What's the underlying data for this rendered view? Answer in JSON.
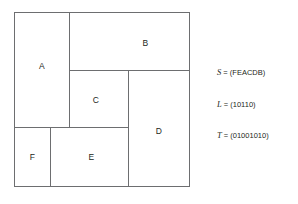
{
  "figure": {
    "line_color": "#6d6e70",
    "text_color": "#231f20",
    "background": "#ffffff"
  },
  "floorplan": {
    "outline": {
      "x": 14,
      "y": 12,
      "width": 176,
      "height": 175
    },
    "blocks": [
      {
        "id": "A",
        "label": "A",
        "x": 0,
        "y": 0,
        "width": 56,
        "height": 116
      },
      {
        "id": "B",
        "label": "B",
        "x": 55,
        "y": 0,
        "width": 121,
        "height": 59
      },
      {
        "id": "C",
        "label": "C",
        "x": 55,
        "y": 58,
        "width": 60,
        "height": 58
      },
      {
        "id": "D",
        "label": "D",
        "x": 114,
        "y": 58,
        "width": 62,
        "height": 117
      },
      {
        "id": "E",
        "label": "E",
        "x": 36,
        "y": 115,
        "width": 79,
        "height": 60
      },
      {
        "id": "F",
        "label": "F",
        "x": 0,
        "y": 115,
        "width": 37,
        "height": 60
      }
    ]
  },
  "equations": [
    {
      "name": "sequence-s",
      "symbol": "S",
      "operator": " = ",
      "value": "(FEACDB)",
      "text": " = (FEACDB)"
    },
    {
      "name": "sequence-l",
      "symbol": "L",
      "operator": " = ",
      "value": "(10110)",
      "text": " = (10110)"
    },
    {
      "name": "sequence-t",
      "symbol": "T",
      "operator": " = ",
      "value": "(01001010)",
      "text": " = (01001010)"
    }
  ]
}
